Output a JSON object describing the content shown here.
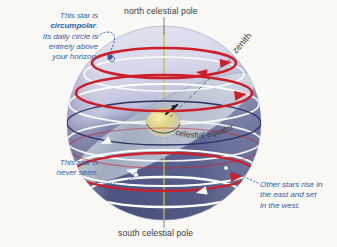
{
  "figure": {
    "background_color": "#faf9f6"
  },
  "labels": {
    "north_celestial_pole": "north celestial pole",
    "south_celestial_pole": "south celestial pole",
    "zenith": "zenith",
    "celestial_equator": "celestial equator"
  },
  "annotations": {
    "circumpolar": {
      "line1": "This star is",
      "emphasis": "circumpolar",
      "emphasis_trailing": ".",
      "line3": "Its daily circle is",
      "line4": "entirely above",
      "line5": "your horizon.",
      "color": "#2f62a8"
    },
    "never_seen": {
      "line1": "This star is",
      "line2": "never seen.",
      "color": "#2f62a8"
    },
    "other_stars": {
      "line1": "Other stars rise in",
      "line2": "the east and set",
      "line3": "in the west.",
      "color": "#2f62a8"
    }
  },
  "colors": {
    "sphere_upper": "#d6d7e9",
    "sphere_lower": "#474f82",
    "visible_path": "#cc1f2a",
    "hidden_path": "#ffffff",
    "celestial_equator": "#2b2f63",
    "rotation_axis": "#c8bd4a",
    "horizon_plane": "#b9c3cf",
    "leader_line": "#8a8a8a",
    "annotation_text": "#2f62a8",
    "pole_label_text": "#3a3a3a",
    "earth_globe": "#e8d98a"
  },
  "geometry": {
    "sphere_center_x": 164,
    "sphere_center_y": 123,
    "sphere_radius": 97,
    "axis_tilt_degrees": 0,
    "zenith_label_rotation_degrees": 56
  },
  "stars": [
    {
      "name": "circumpolar-star",
      "x": 112,
      "y": 59,
      "label_ref": "circumpolar"
    },
    {
      "name": "never-seen-star",
      "x": 133,
      "y": 176,
      "label_ref": "never_seen"
    },
    {
      "name": "rising-setting-star",
      "x": 226,
      "y": 169,
      "label_ref": "other_stars"
    }
  ]
}
